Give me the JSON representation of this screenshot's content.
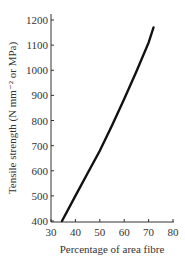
{
  "chart_data": {
    "type": "line",
    "title": "",
    "xlabel": "Percentage of area fibre",
    "ylabel": "Tensile strength (N mm⁻² or MPa)",
    "xlim": [
      30,
      80
    ],
    "ylim": [
      400,
      1200
    ],
    "xticks": [
      30,
      40,
      50,
      60,
      70,
      80
    ],
    "yticks": [
      400,
      500,
      600,
      700,
      800,
      900,
      1000,
      1100,
      1200
    ],
    "grid": false,
    "legend": null,
    "series": [
      {
        "name": "Tensile strength",
        "x": [
          34.5,
          40,
          45,
          50,
          55,
          60,
          65,
          70,
          72
        ],
        "y": [
          400,
          500,
          590,
          680,
          780,
          885,
          995,
          1110,
          1170
        ]
      }
    ]
  }
}
